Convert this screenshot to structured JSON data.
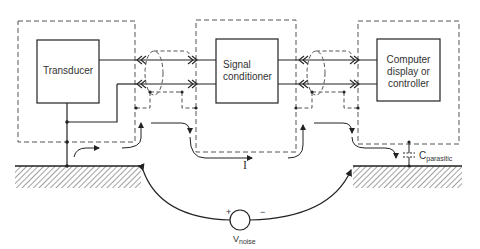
{
  "blocks": {
    "transducer": {
      "label": "Transducer"
    },
    "signal_conditioner": {
      "label_line1": "Signal",
      "label_line2": "conditioner"
    },
    "computer": {
      "label_line1": "Computer",
      "label_line2": "display or",
      "label_line3": "controller"
    }
  },
  "annotations": {
    "current": "I",
    "parasitic_cap": {
      "main": "C",
      "sub": "parasitic"
    },
    "noise_source": {
      "main": "V",
      "sub": "noise",
      "plus": "+",
      "minus": "−"
    }
  },
  "colors": {
    "line": "#222222",
    "dash": "#555555",
    "hatch": "#444444"
  }
}
